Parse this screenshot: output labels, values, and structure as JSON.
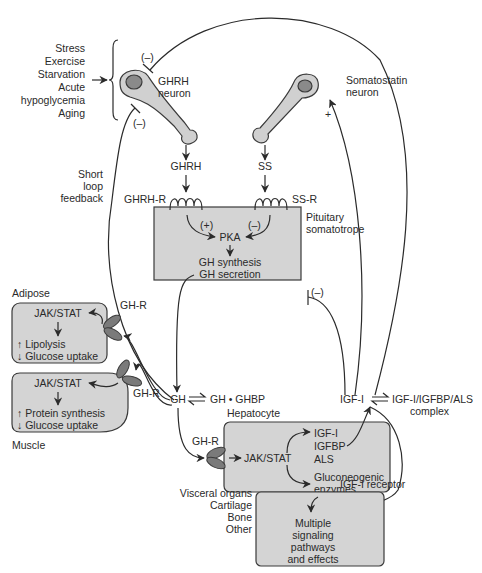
{
  "colors": {
    "box_fill": "#d4d4d4",
    "line": "#2b2b2b",
    "nucleus": "#8a8a8a",
    "receptor": "#7a7a7a",
    "text": "#2a2a2a"
  },
  "stimuli": [
    "Stress",
    "Exercise",
    "Starvation",
    "Acute",
    "hypoglycemia",
    "Aging"
  ],
  "neurons": {
    "ghrh_line1": "GHRH",
    "ghrh_line2": "neuron",
    "ss_line1": "Somatostatin",
    "ss_line2": "neuron"
  },
  "signs": {
    "neg": "(–)",
    "pos_paren": "(+)",
    "plus": "+"
  },
  "hormones": {
    "ghrh": "GHRH",
    "ss": "SS",
    "ghrh_r": "GHRH-R",
    "ss_r": "SS-R"
  },
  "short_loop": [
    "Short",
    "loop",
    "feedback"
  ],
  "pituitary": {
    "label_line1": "Pituitary",
    "label_line2": "somatotrope",
    "pka": "PKA",
    "line1": "GH synthesis",
    "line2": "GH secretion"
  },
  "gh": {
    "gh": "GH",
    "complex": "GH • GHBP",
    "receptor": "GH-R"
  },
  "adipose": {
    "title": "Adipose",
    "pathway": "JAK/STAT",
    "line1": "↑ Lipolysis",
    "line2": "↓ Glucose uptake"
  },
  "muscle": {
    "title": "Muscle",
    "pathway": "JAK/STAT",
    "line1": "↑ Protein synthesis",
    "line2": "↓ Glucose uptake"
  },
  "hepatocyte": {
    "title": "Hepatocyte",
    "pathway": "JAK/STAT",
    "products": [
      "IGF-I",
      "IGFBP",
      "ALS"
    ],
    "enzymes_line1": "Gluconeogenic",
    "enzymes_line2": "enzymes"
  },
  "igf": {
    "igf1": "IGF-I",
    "complex_line1": "IGF-I/IGFBP/ALS",
    "complex_line2": "complex",
    "receptor": "IGF-I receptor"
  },
  "targets": {
    "tissues": [
      "Visceral organs",
      "Cartilage",
      "Bone",
      "Other"
    ],
    "effects": [
      "Multiple",
      "signaling",
      "pathways",
      "and effects"
    ]
  }
}
